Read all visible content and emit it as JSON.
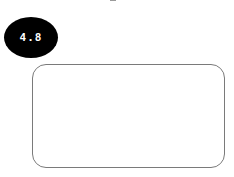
{
  "rating_badge": {
    "value": "4.8",
    "background_color": "#000000",
    "text_color": "#ffffff"
  },
  "content_card": {
    "border_color": "#7a7a7a",
    "background_color": "#ffffff"
  }
}
